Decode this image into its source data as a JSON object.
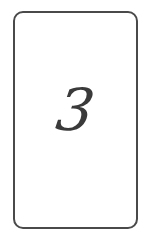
{
  "card": {
    "value": "3",
    "border_color": "#4a4a4a",
    "text_color": "#3a3a3a",
    "background": "#ffffff"
  }
}
